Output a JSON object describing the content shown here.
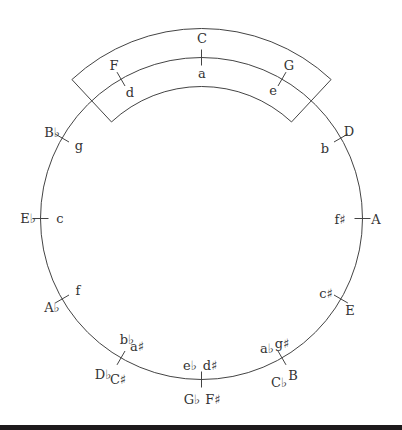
{
  "colors": {
    "stroke": "#444444",
    "text": "#333333",
    "background": "#ffffff",
    "bottom_bar": "#1e1a1c"
  },
  "geometry": {
    "cx": 201.5,
    "cy": 218.5,
    "r": 161,
    "band_inner_r": 132,
    "band_outer_r": 190,
    "band_half_angle_deg": 43
  },
  "highlight_band": {
    "label": "neighboring keys band",
    "covers": [
      "F",
      "C",
      "G"
    ]
  },
  "keys": [
    {
      "angle": 0,
      "major": "C",
      "minor": "a"
    },
    {
      "angle": 30,
      "major": "G",
      "minor": "e"
    },
    {
      "angle": 60,
      "major": "D",
      "minor": "b"
    },
    {
      "angle": 90,
      "major": "A",
      "minor": "f♯"
    },
    {
      "angle": 120,
      "major": "E",
      "minor": "c♯"
    },
    {
      "angle": 150,
      "major": "B",
      "minor": "g♯",
      "major_enharmonic": "C♭",
      "minor_enharmonic": "a♭"
    },
    {
      "angle": 180,
      "major": "F♯",
      "minor": "d♯",
      "major_enharmonic": "G♭",
      "minor_enharmonic": "e♭"
    },
    {
      "angle": 210,
      "major": "C♯",
      "minor": "a♯",
      "major_enharmonic": "D♭",
      "minor_enharmonic": "b♭"
    },
    {
      "angle": 240,
      "major": "A♭",
      "minor": "f"
    },
    {
      "angle": 270,
      "major": "E♭",
      "minor": "c"
    },
    {
      "angle": 300,
      "major": "B♭",
      "minor": "g"
    },
    {
      "angle": 330,
      "major": "F",
      "minor": "d"
    }
  ]
}
